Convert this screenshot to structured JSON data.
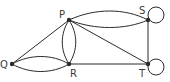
{
  "diagram": {
    "type": "graph",
    "vertices": [
      {
        "id": "P",
        "label": "P"
      },
      {
        "id": "Q",
        "label": "Q"
      },
      {
        "id": "R",
        "label": "R"
      },
      {
        "id": "S",
        "label": "S"
      },
      {
        "id": "T",
        "label": "T"
      }
    ],
    "edges": [
      {
        "from": "P",
        "to": "S",
        "count": 2
      },
      {
        "from": "P",
        "to": "T",
        "count": 1
      },
      {
        "from": "P",
        "to": "Q",
        "count": 1
      },
      {
        "from": "P",
        "to": "R",
        "count": 2
      },
      {
        "from": "Q",
        "to": "R",
        "count": 2
      },
      {
        "from": "R",
        "to": "T",
        "count": 1
      },
      {
        "from": "S",
        "to": "T",
        "count": 1
      },
      {
        "from": "S",
        "to": "S",
        "count": 1,
        "loop": true
      },
      {
        "from": "T",
        "to": "T",
        "count": 1,
        "loop": true
      }
    ],
    "colors": {
      "stroke": "#2b2b2b",
      "label": "#3a3a3a"
    }
  }
}
